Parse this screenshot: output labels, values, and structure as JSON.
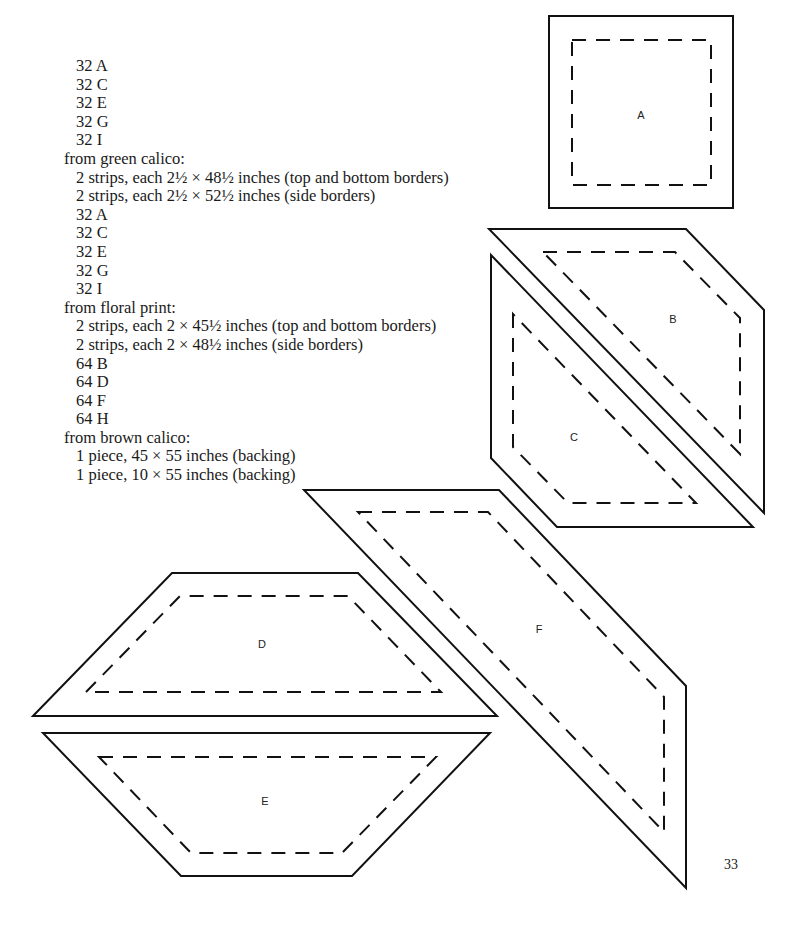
{
  "cutting_list": [
    {
      "text": "32 A",
      "indent": true
    },
    {
      "text": "32 C",
      "indent": true
    },
    {
      "text": "32 E",
      "indent": true
    },
    {
      "text": "32 G",
      "indent": true
    },
    {
      "text": "32 I",
      "indent": true
    },
    {
      "text": "from green calico:",
      "indent": false
    },
    {
      "text": "2 strips, each 2½ × 48½ inches (top and bottom borders)",
      "indent": true
    },
    {
      "text": "2 strips, each 2½ × 52½ inches (side borders)",
      "indent": true
    },
    {
      "text": "32 A",
      "indent": true
    },
    {
      "text": "32 C",
      "indent": true
    },
    {
      "text": "32 E",
      "indent": true
    },
    {
      "text": "32 G",
      "indent": true
    },
    {
      "text": "32 I",
      "indent": true
    },
    {
      "text": "from floral print:",
      "indent": false
    },
    {
      "text": "2 strips, each 2 × 45½ inches (top and bottom borders)",
      "indent": true
    },
    {
      "text": "2 strips, each 2 × 48½ inches (side borders)",
      "indent": true
    },
    {
      "text": "64 B",
      "indent": true
    },
    {
      "text": "64 D",
      "indent": true
    },
    {
      "text": "64 F",
      "indent": true
    },
    {
      "text": "64 H",
      "indent": true
    },
    {
      "text": "from brown calico:",
      "indent": false
    },
    {
      "text": "1 piece, 45 × 55 inches (backing)",
      "indent": true
    },
    {
      "text": "1 piece, 10 × 55 inches (backing)",
      "indent": true
    }
  ],
  "pattern_pieces": {
    "a": {
      "label": "A"
    },
    "b": {
      "label": "B"
    },
    "c": {
      "label": "C"
    },
    "d": {
      "label": "D"
    },
    "e": {
      "label": "E"
    },
    "f": {
      "label": "F"
    }
  },
  "page_number": "33"
}
